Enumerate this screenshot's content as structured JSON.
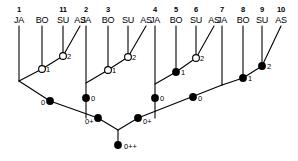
{
  "diagram": {
    "type": "cladogram",
    "taxon_labels": [
      "JA",
      "BO",
      "SU",
      "AS"
    ],
    "tip_groups": [
      {
        "group_id": "group-1",
        "numbers": [
          "1",
          "",
          "11",
          ""
        ],
        "labels": [
          "JA",
          "BO",
          "SU",
          "AS"
        ],
        "nodes": [
          {
            "id": "g1-n1",
            "label": "1",
            "filled": false
          },
          {
            "id": "g1-n2",
            "label": "2",
            "filled": false
          }
        ]
      },
      {
        "group_id": "group-2",
        "numbers": [
          "2",
          "3",
          "",
          ""
        ],
        "labels": [
          "JA",
          "BO",
          "SU",
          "AS"
        ],
        "nodes": [
          {
            "id": "g2-n1",
            "label": "1",
            "filled": false
          },
          {
            "id": "g2-n2",
            "label": "2",
            "filled": false
          }
        ]
      },
      {
        "group_id": "group-3",
        "numbers": [
          "4",
          "5",
          "6",
          ""
        ],
        "labels": [
          "JA",
          "BO",
          "SU",
          "AS"
        ],
        "nodes": [
          {
            "id": "g3-n1",
            "label": "1",
            "filled": true
          },
          {
            "id": "g3-n2",
            "label": "2",
            "filled": false
          }
        ]
      },
      {
        "group_id": "group-4",
        "numbers": [
          "7",
          "8",
          "9",
          "10"
        ],
        "labels": [
          "JA",
          "BO",
          "SU",
          "AS"
        ],
        "nodes": [
          {
            "id": "g4-n1",
            "label": "1",
            "filled": true
          },
          {
            "id": "g4-n2",
            "label": "2",
            "filled": true
          }
        ]
      }
    ],
    "internal_nodes": [
      {
        "id": "node-zero-1",
        "label": "0",
        "filled": true,
        "label_side": "left"
      },
      {
        "id": "node-zero-2",
        "label": "0",
        "filled": true,
        "label_side": "right"
      },
      {
        "id": "node-zero-3",
        "label": "0",
        "filled": true,
        "label_side": "right"
      },
      {
        "id": "node-zero-4",
        "label": "0",
        "filled": true,
        "label_side": "right"
      },
      {
        "id": "node-zeroplus-left",
        "label": "0+",
        "filled": true,
        "label_side": "left"
      },
      {
        "id": "node-zeroplus-right",
        "label": "0+",
        "filled": true,
        "label_side": "right"
      },
      {
        "id": "node-root",
        "label": "0++",
        "filled": true,
        "label_side": "right"
      }
    ],
    "colors": {
      "line": "#000000",
      "node_filled": "#000000",
      "node_open_fill": "#ffffff",
      "node_stroke": "#000000",
      "background": "#ffffff",
      "text": "#000000"
    }
  },
  "geometry": {
    "tip_x": [
      19,
      42,
      63,
      80,
      86,
      108,
      128,
      146,
      155,
      176,
      196,
      214,
      222,
      243,
      262,
      281
    ],
    "tip_label_y": 22,
    "tip_number_y": 10,
    "tip_line_top": 26
  }
}
